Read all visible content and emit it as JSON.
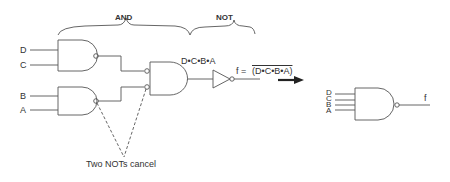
{
  "diagram": {
    "title_and": "AND",
    "title_not": "NOT",
    "inputs_left": [
      "D",
      "C",
      "B",
      "A"
    ],
    "intermediate_label": "D•C•B•A",
    "output_expr_prefix": "f =",
    "output_expr": "(D•C•B•A)",
    "annotation": "Two NOTs cancel",
    "equivalent_inputs": [
      "D",
      "C",
      "B",
      "A"
    ],
    "equivalent_output": "f",
    "arrow": "right-arrow-icon",
    "colors": {
      "line": "#555555",
      "text": "#333333",
      "arrow": "#222222"
    }
  }
}
